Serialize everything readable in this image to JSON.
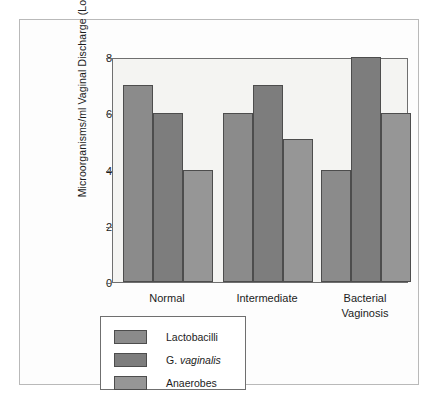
{
  "chart_data": {
    "type": "bar",
    "title": "",
    "subtitle": "",
    "xlabel": "",
    "ylabel": "Microorganisms/ml Vaginal Discharge (Log10)",
    "ylabel_main": "Microorganisms/ml Vaginal Discharge (Log",
    "ylabel_sub": "10",
    "ylabel_tail": ")",
    "categories": [
      "Normal",
      "Intermediate",
      "Bacterial\nVaginosis"
    ],
    "series": [
      {
        "name": "Lactobacilli",
        "values": [
          7.0,
          6.0,
          4.0
        ],
        "color": "#8b8b8b"
      },
      {
        "name": "G. vaginalis",
        "values": [
          6.0,
          7.0,
          8.0
        ],
        "color": "#7d7d7d"
      },
      {
        "name": "Anaerobes",
        "values": [
          4.0,
          5.1,
          6.0
        ],
        "color": "#969696"
      }
    ],
    "ylim": [
      0,
      8
    ],
    "yticks": [
      0,
      2,
      4,
      6,
      8
    ],
    "ytick_labels": [
      "0",
      "2",
      "4",
      "6",
      "8"
    ],
    "grid": false,
    "legend_position": "below-left",
    "legend_entries": [
      {
        "label": "Lactobacilli",
        "italic": false
      },
      {
        "label": "G. vaginalis",
        "italic": true,
        "roman_prefix": "G. ",
        "italic_part": "vaginalis"
      },
      {
        "label": "Anaerobes",
        "italic": false
      }
    ],
    "colors": {
      "plot_background": "#f4f4f2",
      "axis": "#6f6f6f",
      "bar_outline": "#4d4d4d",
      "text": "#1c1c1c",
      "frame": "#b9b9b9"
    }
  }
}
